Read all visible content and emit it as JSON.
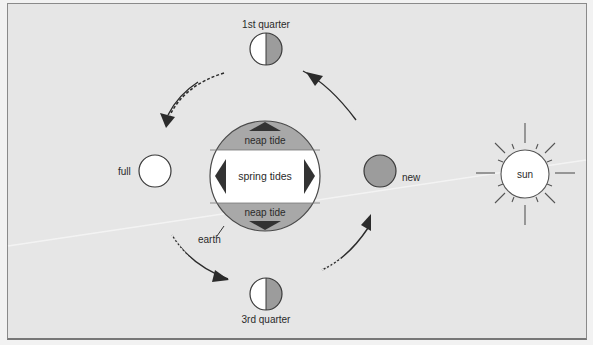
{
  "diagram": {
    "title": "",
    "moon_phases": [
      {
        "id": "first-quarter",
        "label": "1st quarter",
        "type": "half",
        "cx": 266,
        "cy": 49,
        "r": 16
      },
      {
        "id": "full",
        "label": "full",
        "type": "full",
        "cx": 155,
        "cy": 171,
        "r": 16
      },
      {
        "id": "new",
        "label": "new",
        "type": "new",
        "cx": 380,
        "cy": 171,
        "r": 16
      },
      {
        "id": "third-quarter",
        "label": "3rd quarter",
        "type": "half",
        "cx": 266,
        "cy": 294,
        "r": 16
      }
    ],
    "earth": {
      "label": "earth",
      "neap_top_label": "neap tide",
      "spring_label": "spring tides",
      "neap_bottom_label": "neap tide"
    },
    "sun": {
      "label": "sun"
    },
    "colors": {
      "background": "#e6e6e6",
      "earth_neap": "#a8a8a8",
      "moon_dark": "#9c9c9c",
      "arrow": "#2b2b2b",
      "outline": "#3a3a3a",
      "white": "#ffffff"
    }
  }
}
